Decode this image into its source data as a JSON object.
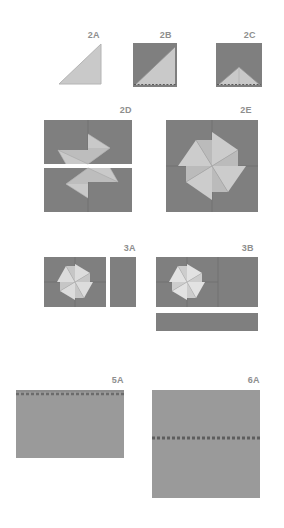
{
  "document": {
    "kind": "origami-folding-diagram",
    "title_visible": false,
    "background_color": "#ffffff"
  },
  "palette": {
    "paper_dark": "#7f7f7f",
    "paper_mid": "#9a9a9a",
    "paper_light": "#c9c9c9",
    "paper_lighter": "#dcdcdc",
    "crease_line": "#6e6e6e",
    "dashed_line": "#5a5a5a",
    "label_text": "#8e8e8e",
    "page_background": "#ffffff"
  },
  "steps": [
    {
      "id": "2A",
      "label": "2A",
      "description": "Light gray right triangle, right angle at lower right",
      "shape": "triangle",
      "fill": "#c9c9c9"
    },
    {
      "id": "2B",
      "label": "2B",
      "description": "Dark square with light triangle folded across lower right, dashed fold line along bottom edge",
      "shape": "square-with-diagonal-fold",
      "fill_dark": "#7f7f7f",
      "fill_light": "#c9c9c9"
    },
    {
      "id": "2C",
      "label": "2C",
      "description": "Dark square with light triangular flap folded up at bottom center, dashed line along bottom",
      "shape": "square-with-notch-fold",
      "fill_dark": "#7f7f7f",
      "fill_light": "#c9c9c9"
    },
    {
      "id": "2D",
      "label": "2D",
      "description": "Two stacked wide rectangles, each showing a half pinwheel of folded light blades on dark paper",
      "shape": "two-stacked-rectangles-half-pinwheel",
      "fill_dark": "#7f7f7f",
      "fill_light": "#c9c9c9"
    },
    {
      "id": "2E",
      "label": "2E",
      "description": "Single dark square with a complete four blade pinwheel of light folded paper at center",
      "shape": "square-full-pinwheel",
      "fill_dark": "#7f7f7f",
      "fill_light": "#c9c9c9"
    },
    {
      "id": "3A",
      "label": "3A",
      "description": "Small dark square with four blade pinwheel, plus a plain narrow vertical rectangle to its right",
      "shape": "square-pinwheel-plus-vertical-strip",
      "fill_dark": "#7f7f7f",
      "fill_light": "#dcdcdc"
    },
    {
      "id": "3B",
      "label": "3B",
      "description": "Wide dark rectangle with four blade pinwheel on the left half, plus a plain wide horizontal strip below",
      "shape": "rect-pinwheel-plus-horizontal-strip",
      "fill_dark": "#7f7f7f",
      "fill_light": "#dcdcdc"
    },
    {
      "id": "5A",
      "label": "5A",
      "description": "Plain medium gray wide rectangle with a thin dashed fold line near the top edge",
      "shape": "rectangle-with-top-fold-line",
      "fill": "#9a9a9a"
    },
    {
      "id": "6A",
      "label": "6A",
      "description": "Plain medium gray square with a thin dashed fold line across the middle",
      "shape": "square-with-center-fold-line",
      "fill": "#9a9a9a"
    }
  ]
}
